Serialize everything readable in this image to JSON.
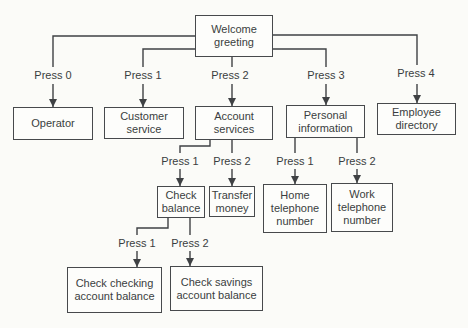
{
  "diagram": {
    "nodes": {
      "welcome_greeting": {
        "label": "Welcome greeting"
      },
      "operator": {
        "label": "Operator"
      },
      "customer_service": {
        "label": "Customer service"
      },
      "account_services": {
        "label": "Account services"
      },
      "personal_information": {
        "label": "Personal information"
      },
      "employee_directory": {
        "label": "Employee directory"
      },
      "check_balance": {
        "label": "Check balance"
      },
      "transfer_money": {
        "label": "Transfer money"
      },
      "home_telephone_number": {
        "label": "Home telephone number"
      },
      "work_telephone_number": {
        "label": "Work telephone number"
      },
      "check_checking_account_balance": {
        "label": "Check checking account balance"
      },
      "check_savings_account_balance": {
        "label": "Check savings account balance"
      }
    },
    "edge_labels": {
      "root_press_0": "Press 0",
      "root_press_1": "Press 1",
      "root_press_2": "Press 2",
      "root_press_3": "Press 3",
      "root_press_4": "Press 4",
      "account_press_1": "Press 1",
      "account_press_2": "Press 2",
      "personal_press_1": "Press 1",
      "personal_press_2": "Press 2",
      "balance_press_1": "Press 1",
      "balance_press_2": "Press 2"
    },
    "colors": {
      "line": "#3f4144",
      "text": "#3a3d40",
      "box_border": "#47494c",
      "box_fill": "#fdfdfb",
      "background": "#fbfbf8"
    }
  }
}
